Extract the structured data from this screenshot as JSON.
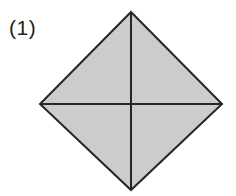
{
  "figure": {
    "label": "(1)",
    "caption_position": "top-left",
    "shape_name": "square-rotated-45",
    "background_color": "#ffffff",
    "fill_color": "#cccccc",
    "stroke_color": "#262626",
    "stroke_width": 2,
    "diagonal_stroke_width": 2,
    "vertices": {
      "top": {
        "x": 131,
        "y": 12
      },
      "right": {
        "x": 222,
        "y": 104
      },
      "bottom": {
        "x": 131,
        "y": 190
      },
      "left": {
        "x": 40,
        "y": 104
      }
    },
    "center": {
      "x": 131,
      "y": 104
    },
    "outline_points": "131,12 222,104 131,190 40,104",
    "diagonals": [
      {
        "name": "vertical-diagonal",
        "x1": 131,
        "y1": 12,
        "x2": 131,
        "y2": 190
      },
      {
        "name": "horizontal-diagonal",
        "x1": 40,
        "y1": 104,
        "x2": 222,
        "y2": 104
      }
    ]
  },
  "canvas": {
    "width": 236,
    "height": 196
  }
}
